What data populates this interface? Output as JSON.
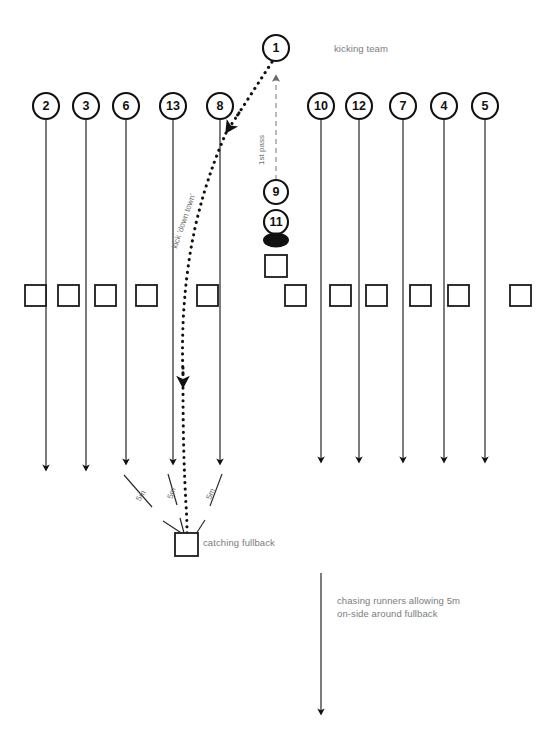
{
  "diagram": {
    "colors": {
      "ink": "#111111",
      "annotation_gray": "#7b7b7b",
      "background": "#ffffff"
    }
  },
  "labels": {
    "kicking_team": "kicking team",
    "first_pass": "1st pass",
    "kick_down_town": "kick 'down town'",
    "catching_fullback": "catching fullback",
    "chasing_runners_line1": "chasing runners allowing 5m",
    "chasing_runners_line2": "on-side around fullback",
    "distance_1": "5m",
    "distance_2": "5m",
    "distance_3": "5m"
  },
  "players": {
    "left_group": [
      {
        "number": "2",
        "cx": 46,
        "cy": 106,
        "line_end_y": 468
      },
      {
        "number": "3",
        "cx": 86,
        "cy": 106,
        "line_end_y": 468
      },
      {
        "number": "6",
        "cx": 126,
        "cy": 106,
        "line_end_y": 462
      },
      {
        "number": "13",
        "cx": 173,
        "cy": 106,
        "line_end_y": 462
      },
      {
        "number": "8",
        "cx": 220,
        "cy": 106,
        "line_end_y": 462
      }
    ],
    "right_group": [
      {
        "number": "10",
        "cx": 321,
        "cy": 106,
        "line_end_y": 460
      },
      {
        "number": "12",
        "cx": 359,
        "cy": 106,
        "line_end_y": 460
      },
      {
        "number": "7",
        "cx": 403,
        "cy": 106,
        "line_end_y": 460
      },
      {
        "number": "4",
        "cx": 444,
        "cy": 106,
        "line_end_y": 460
      },
      {
        "number": "5",
        "cx": 485,
        "cy": 106,
        "line_end_y": 460
      }
    ],
    "kicker": {
      "number": "1",
      "cx": 276,
      "cy": 48
    },
    "scrumhalf": {
      "number": "9",
      "cx": 276,
      "cy": 192
    },
    "receiver": {
      "number": "11",
      "cx": 276,
      "cy": 222
    }
  },
  "opposition_squares": {
    "row_y": 285,
    "size": 21,
    "left_x": [
      25,
      58,
      95,
      136,
      197
    ],
    "right_x": [
      285,
      330,
      366,
      410,
      448,
      510
    ],
    "center_x": [
      265
    ]
  },
  "fullback": {
    "x": 175,
    "y": 533,
    "size": 23
  },
  "ball": {
    "cx": 276,
    "cy": 240,
    "rx": 13,
    "ry": 7
  },
  "chase_arrow": {
    "x": 321,
    "y_start": 573,
    "y_end": 712
  }
}
